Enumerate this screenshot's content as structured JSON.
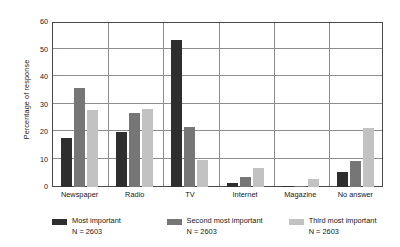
{
  "chart_data": {
    "type": "bar",
    "title": "",
    "xlabel": "",
    "ylabel": "Percentage of response",
    "ylim": [
      0,
      60
    ],
    "yticks": [
      0,
      10,
      20,
      30,
      40,
      50,
      60
    ],
    "ytick_labels": [
      "0",
      "10",
      "20",
      "30",
      "40",
      "50",
      "60"
    ],
    "grid": true,
    "legend_position": "bottom",
    "categories": [
      "Newspaper",
      "Radio",
      "TV",
      "Internet",
      "Magazine",
      "No answer"
    ],
    "series": [
      {
        "name": "Most important",
        "sublabel": "N = 2603",
        "color": "#2e2e2e",
        "values": [
          18,
          20,
          53.5,
          1.5,
          0.3,
          5.3
        ]
      },
      {
        "name": "Second most important",
        "sublabel": "N = 2603",
        "color": "#767676",
        "values": [
          36,
          27,
          22,
          3.5,
          0.5,
          9.3
        ]
      },
      {
        "name": "Third most important",
        "sublabel": "N = 2603",
        "color": "#c2c2c2",
        "values": [
          28,
          28.5,
          10,
          7,
          3,
          21.5
        ]
      }
    ]
  }
}
